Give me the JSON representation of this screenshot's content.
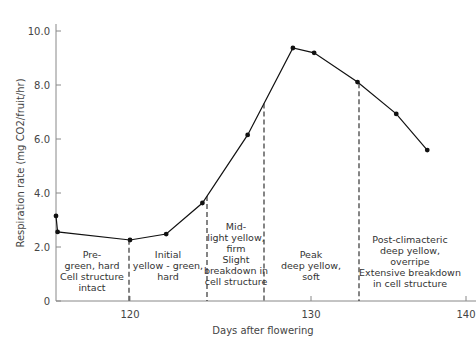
{
  "chart_data": {
    "type": "line",
    "title": "",
    "xlabel": "Days after flowering",
    "ylabel": "Respiration rate (mg CO2/fruit/hr)",
    "xlim": [
      114,
      140
    ],
    "ylim": [
      0,
      10.0
    ],
    "x_ticks": [
      "120",
      "130",
      "140"
    ],
    "y_ticks": [
      "0",
      "2.0",
      "4.0",
      "6.0",
      "8.0",
      "10.0"
    ],
    "grid": false,
    "series": [
      {
        "name": "Respiration rate",
        "x": [
          114,
          116,
          120,
          122,
          124,
          126.5,
          129,
          130.2,
          133,
          135.5,
          137.5
        ],
        "values": [
          3.15,
          2.56,
          2.26,
          2.48,
          3.63,
          6.15,
          9.37,
          9.19,
          8.11,
          6.93,
          5.59
        ]
      }
    ],
    "stage_boundaries_days": [
      120,
      124,
      127,
      133
    ],
    "stages": [
      {
        "lines": [
          "Pre-",
          "green, hard",
          "Cell structure",
          "intact"
        ]
      },
      {
        "lines": [
          "Initial",
          "yellow - green,",
          "hard"
        ]
      },
      {
        "lines": [
          "Mid-",
          "light yellow,",
          "firm",
          "Slight",
          "breakdown in",
          "cell structure"
        ]
      },
      {
        "lines": [
          "Peak",
          "deep yellow,",
          "soft"
        ]
      },
      {
        "lines": [
          "Post-climacteric",
          "deep yellow,",
          "overripe",
          "Extensive breakdown",
          "in cell structure"
        ]
      }
    ]
  }
}
